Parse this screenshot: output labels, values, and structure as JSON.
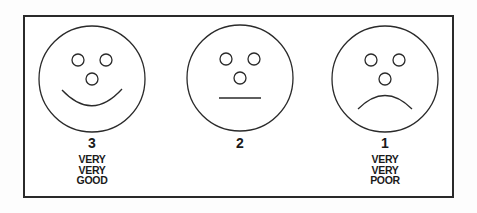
{
  "scale": {
    "items": [
      {
        "face": "happy-face",
        "number": "3",
        "label_lines": [
          "VERY",
          "VERY",
          "GOOD"
        ]
      },
      {
        "face": "neutral-face",
        "number": "2",
        "label_lines": []
      },
      {
        "face": "sad-face",
        "number": "1",
        "label_lines": [
          "VERY",
          "VERY",
          "POOR"
        ]
      }
    ]
  },
  "colors": {
    "stroke": "#2a2a2a",
    "background": "#ffffff"
  }
}
